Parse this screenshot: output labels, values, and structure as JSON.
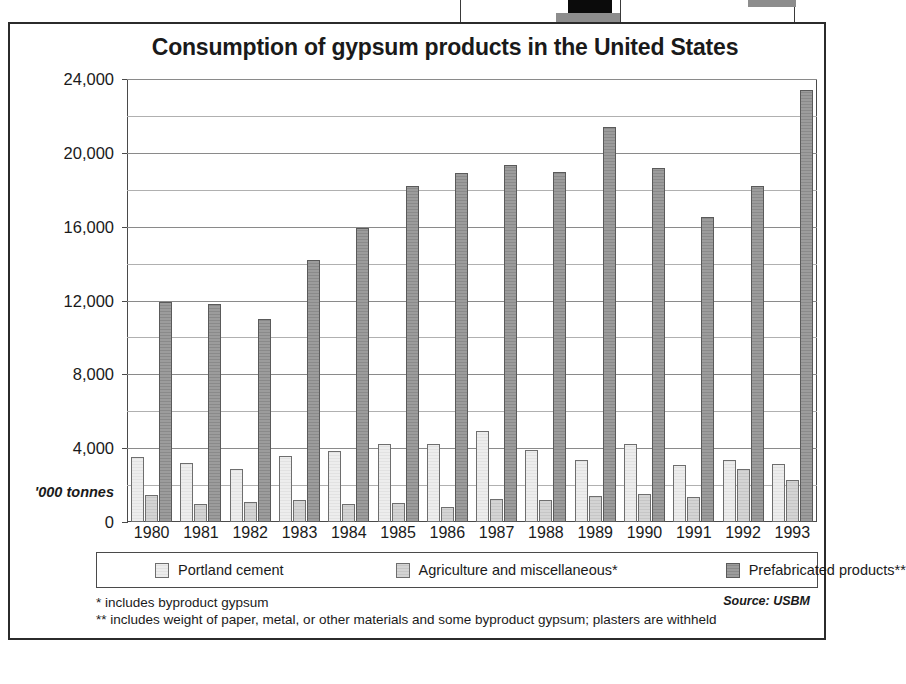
{
  "figure": {
    "title": "Consumption of gypsum products in the United States",
    "y_unit_label": "'000 tonnes",
    "source": "Source: USBM",
    "footnotes": [
      "* includes byproduct gypsum",
      "** includes weight of paper, metal, or other materials and some byproduct gypsum; plasters are withheld"
    ]
  },
  "chart_data": {
    "type": "bar",
    "title": "Consumption of gypsum products in the United States",
    "xlabel": "",
    "ylabel": "'000 tonnes",
    "ylim": [
      0,
      24000
    ],
    "yticks": [
      "0",
      "4,000",
      "8,000",
      "12,000",
      "16,000",
      "20,000",
      "24,000"
    ],
    "ytick_values": [
      0,
      4000,
      8000,
      12000,
      16000,
      20000,
      24000
    ],
    "minor_gridlines": true,
    "minor_tick_values": [
      2000,
      6000,
      10000,
      14000,
      18000,
      22000
    ],
    "grid": true,
    "legend_position": "bottom",
    "categories": [
      "1980",
      "1981",
      "1982",
      "1983",
      "1984",
      "1985",
      "1986",
      "1987",
      "1988",
      "1989",
      "1990",
      "1991",
      "1992",
      "1993"
    ],
    "series": [
      {
        "name": "Portland cement",
        "values": [
          3500,
          3200,
          2850,
          3550,
          3850,
          4200,
          4250,
          4950,
          3900,
          3350,
          4250,
          3100,
          3350,
          3150
        ]
      },
      {
        "name": "Agriculture and miscellaneous*",
        "values": [
          1450,
          1000,
          1100,
          1200,
          1000,
          1050,
          800,
          1250,
          1200,
          1400,
          1500,
          1350,
          2850,
          2300
        ]
      },
      {
        "name": "Prefabricated products**",
        "values": [
          11900,
          11800,
          11000,
          14200,
          15950,
          18200,
          18900,
          19350,
          18950,
          21400,
          19200,
          16550,
          18200,
          23400
        ]
      }
    ]
  },
  "legend": [
    {
      "label": "Portland cement"
    },
    {
      "label": "Agriculture and miscellaneous*"
    },
    {
      "label": "Prefabricated products**"
    }
  ]
}
